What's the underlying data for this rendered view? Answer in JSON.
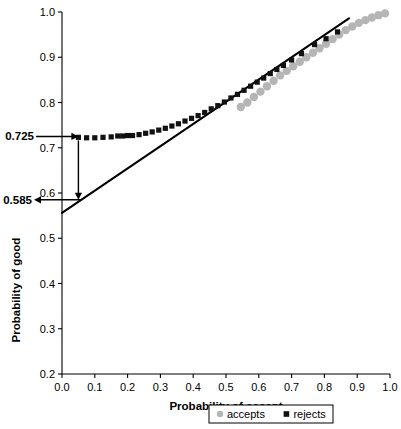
{
  "chart_data": {
    "type": "scatter",
    "title": "",
    "xlabel": "Probability of accept",
    "ylabel": "Probability of good",
    "xlim": [
      0.0,
      1.0
    ],
    "ylim": [
      0.2,
      1.0
    ],
    "grid": false,
    "legend_position": "bottom",
    "xticks": [
      "0.0",
      "0.1",
      "0.2",
      "0.3",
      "0.4",
      "0.5",
      "0.6",
      "0.7",
      "0.8",
      "0.9",
      "1.0"
    ],
    "xtick_values": [
      0.0,
      0.1,
      0.2,
      0.3,
      0.4,
      0.5,
      0.6,
      0.7,
      0.8,
      0.9,
      1.0
    ],
    "yticks": [
      "0.2",
      "0.3",
      "0.4",
      "0.5",
      "0.6",
      "0.7",
      "0.8",
      "0.9",
      "1.0"
    ],
    "ytick_values": [
      0.2,
      0.3,
      0.4,
      0.5,
      0.6,
      0.7,
      0.8,
      0.9,
      1.0
    ],
    "series": [
      {
        "name": "accepts",
        "marker": "circle",
        "color": "#b5b5b5",
        "x": [
          0.545,
          0.565,
          0.585,
          0.605,
          0.625,
          0.645,
          0.665,
          0.685,
          0.705,
          0.725,
          0.745,
          0.765,
          0.785,
          0.805,
          0.825,
          0.845,
          0.865,
          0.885,
          0.905,
          0.925,
          0.945,
          0.965,
          0.985
        ],
        "y": [
          0.79,
          0.8,
          0.812,
          0.824,
          0.836,
          0.848,
          0.86,
          0.87,
          0.88,
          0.89,
          0.9,
          0.91,
          0.92,
          0.93,
          0.94,
          0.95,
          0.96,
          0.968,
          0.976,
          0.982,
          0.988,
          0.993,
          0.997
        ]
      },
      {
        "name": "rejects",
        "marker": "square",
        "color": "#111111",
        "x": [
          0.05,
          0.075,
          0.1,
          0.125,
          0.15,
          0.17,
          0.185,
          0.2,
          0.215,
          0.235,
          0.255,
          0.275,
          0.295,
          0.315,
          0.335,
          0.355,
          0.375,
          0.395,
          0.415,
          0.435,
          0.455,
          0.475,
          0.495,
          0.515,
          0.535,
          0.555,
          0.575,
          0.595,
          0.615,
          0.635,
          0.655,
          0.675,
          0.7,
          0.73,
          0.77,
          0.805,
          0.84
        ],
        "y": [
          0.723,
          0.722,
          0.722,
          0.723,
          0.724,
          0.726,
          0.726,
          0.727,
          0.727,
          0.729,
          0.732,
          0.735,
          0.739,
          0.743,
          0.748,
          0.753,
          0.759,
          0.765,
          0.771,
          0.778,
          0.786,
          0.793,
          0.801,
          0.81,
          0.818,
          0.827,
          0.836,
          0.845,
          0.854,
          0.864,
          0.873,
          0.882,
          0.894,
          0.908,
          0.928,
          0.941,
          0.956
        ]
      }
    ],
    "reference_line": {
      "name": "diagonal",
      "color": "#000000",
      "x": [
        0.0,
        0.875
      ],
      "y": [
        0.556,
        0.986
      ]
    },
    "annotations": [
      {
        "name": "upper-annotation",
        "label": "0.725",
        "value": 0.725,
        "arrow": "right",
        "target_x": 0.05
      },
      {
        "name": "lower-annotation",
        "label": "0.585",
        "value": 0.585,
        "arrow": "left",
        "target_x": 0.05
      },
      {
        "name": "drop-arrow",
        "label": "",
        "from_y": 0.725,
        "to_y": 0.585,
        "at_x": 0.05,
        "arrow": "down"
      }
    ],
    "legend": [
      {
        "label": "accepts",
        "marker": "circle",
        "color": "#b5b5b5"
      },
      {
        "label": "rejects",
        "marker": "square",
        "color": "#111111"
      }
    ]
  }
}
